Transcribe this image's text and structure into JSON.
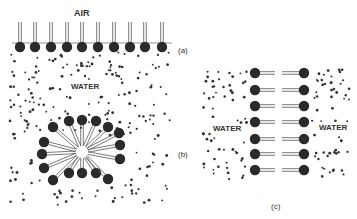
{
  "labels": {
    "air": "AIR",
    "water_top": "WATER",
    "water_left": "WATER",
    "water_right": "WATER",
    "panel_a": "(a)",
    "panel_b": "(b)",
    "panel_c": "(c)"
  },
  "panels": [
    {
      "id": "a",
      "description": "Surfactant monolayer at air-water interface",
      "head_count": 10
    },
    {
      "id": "b",
      "description": "Micelle in water",
      "head_count": 16
    },
    {
      "id": "c",
      "description": "Bilayer between water regions",
      "head_count": 14
    }
  ],
  "colors": {
    "head": "#2a2a2a",
    "tail": "#555555",
    "dot": "#333333"
  }
}
